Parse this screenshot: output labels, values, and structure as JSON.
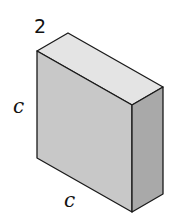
{
  "diagram": {
    "type": "rectangular-prism",
    "labels": {
      "depth": "2",
      "height": "c",
      "width": "c"
    },
    "colors": {
      "top_face": "#e4e4e4",
      "front_face": "#c8c8c8",
      "side_face": "#a9a9a9",
      "edge": "#1a1a1a"
    }
  }
}
